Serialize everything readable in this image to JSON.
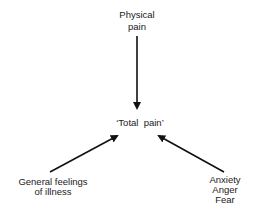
{
  "diagram": {
    "center": {
      "label": "‘Total  pain’"
    },
    "top": {
      "line1": "Physical",
      "line2": "pain"
    },
    "bottom_left": {
      "line1": "General feelings",
      "line2": "of illness"
    },
    "bottom_right": {
      "line1": "Anxiety",
      "line2": "Anger",
      "line3": "Fear"
    },
    "arrow_color": "#111111"
  }
}
